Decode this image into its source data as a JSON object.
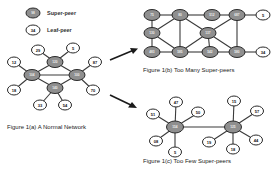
{
  "legend": {
    "super_peer": {
      "symbol_label": "98",
      "text": "Super-peer"
    },
    "leaf_peer": {
      "symbol_label": "34",
      "text": "Leaf-peer"
    }
  },
  "figures": {
    "a": {
      "caption": "Figure 1(a) A Normal Network",
      "super_peers": [
        {
          "id": "s_top",
          "label": "120"
        },
        {
          "id": "s_left",
          "label": "104"
        },
        {
          "id": "s_right",
          "label": "100"
        },
        {
          "id": "s_bottom",
          "label": "140"
        }
      ],
      "leaf_peers": [
        {
          "id": "l29",
          "label": "29"
        },
        {
          "id": "l5",
          "label": "5"
        },
        {
          "id": "l12",
          "label": "12"
        },
        {
          "id": "l87",
          "label": "87"
        },
        {
          "id": "l18",
          "label": "18"
        },
        {
          "id": "l70",
          "label": "70"
        },
        {
          "id": "l33",
          "label": "33"
        },
        {
          "id": "l54",
          "label": "54"
        }
      ]
    },
    "b": {
      "caption": "Figure 1(b) Too Many Super-peers",
      "super_peers": [
        {
          "id": "r1c1",
          "label": "75"
        },
        {
          "id": "r1c2",
          "label": "80"
        },
        {
          "id": "r1c3",
          "label": "512"
        },
        {
          "id": "r1c4",
          "label": "687"
        },
        {
          "id": "r2c1",
          "label": "130"
        },
        {
          "id": "r2c2",
          "label": "137"
        },
        {
          "id": "r3c1",
          "label": "483"
        },
        {
          "id": "r3c2",
          "label": "585"
        },
        {
          "id": "r3c3",
          "label": "542"
        },
        {
          "id": "r3c4",
          "label": "580"
        }
      ],
      "leaf_peers": [
        {
          "id": "lb5",
          "label": "5"
        },
        {
          "id": "lb34",
          "label": "34"
        }
      ]
    },
    "c": {
      "caption": "Figure 1(c) Too Few Super-peers",
      "super_peers": [
        {
          "id": "hub_left",
          "label": "154"
        },
        {
          "id": "hub_right",
          "label": "125"
        }
      ],
      "leaf_peers_left": [
        {
          "label": "47"
        },
        {
          "label": "51"
        },
        {
          "label": "50"
        },
        {
          "label": "08"
        },
        {
          "label": "5"
        }
      ],
      "leaf_peers_right": [
        {
          "label": "15"
        },
        {
          "label": "57"
        },
        {
          "label": "19"
        },
        {
          "label": "44"
        },
        {
          "label": "18"
        }
      ]
    }
  },
  "colors": {
    "super_fill": "#8f8f8f",
    "leaf_fill": "#ffffff",
    "stroke": "#2a2a2a"
  }
}
